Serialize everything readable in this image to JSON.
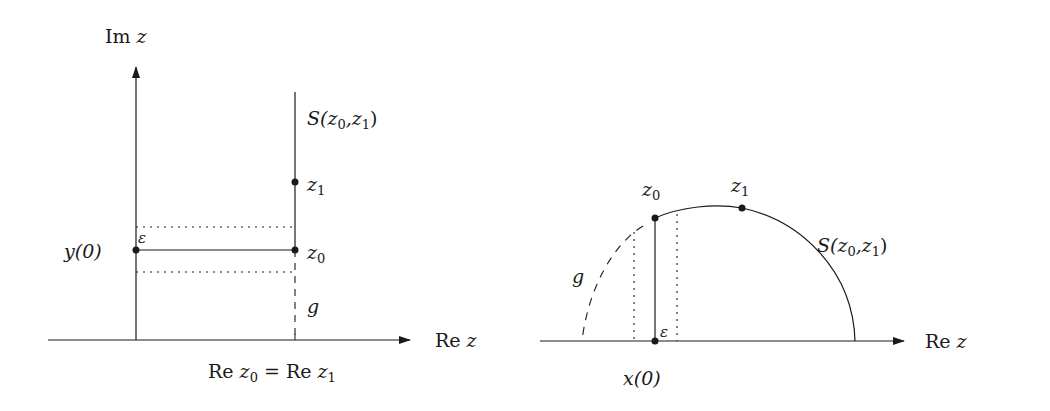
{
  "left_figure": {
    "y_axis_label": {
      "prefix": "Im",
      "var": "z"
    },
    "x_axis_label": {
      "prefix": "Re",
      "var": "z"
    },
    "curve_label": {
      "name": "S",
      "args": "(z",
      "sub0": "0",
      "comma": ",z",
      "sub1": "1",
      "close": ")"
    },
    "point_z1": {
      "var": "z",
      "sub": "1"
    },
    "point_z0": {
      "var": "z",
      "sub": "0"
    },
    "point_y0": {
      "text": "y(0)"
    },
    "epsilon": "ε",
    "g_label": "g",
    "bottom_label": {
      "re1": "Re",
      "z0": "z",
      "sub0": "0",
      "eq": "=",
      "re2": "Re",
      "z1": "z",
      "sub1": "1"
    }
  },
  "right_figure": {
    "x_axis_label": {
      "prefix": "Re",
      "var": "z"
    },
    "curve_label": {
      "name": "S",
      "args": "(z",
      "sub0": "0",
      "comma": ",z",
      "sub1": "1",
      "close": ")"
    },
    "point_z0": {
      "var": "z",
      "sub": "0"
    },
    "point_z1": {
      "var": "z",
      "sub": "1"
    },
    "point_x0": {
      "text": "x(0)"
    },
    "epsilon": "ε",
    "g_label": "g"
  },
  "colors": {
    "ink": "#1a1a1a",
    "background": "#ffffff"
  }
}
